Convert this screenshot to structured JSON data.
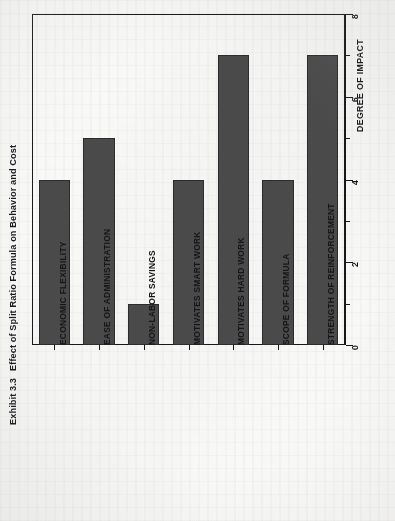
{
  "exhibit": {
    "number": "Exhibit 3.3",
    "title": "Effect of Split Ratio Formula on Behavior and Cost"
  },
  "colors": {
    "bar_fill": "#4a4a4a",
    "axis": "#17181c",
    "paper": "#fbfbfa",
    "text": "#15161a"
  },
  "chart_data": {
    "type": "bar",
    "orientation": "rotated-90-ccw",
    "title": "Effect of Split Ratio Formula on Behavior and Cost",
    "xlabel": "",
    "ylabel": "DEGREE OF IMPACT",
    "ylim": [
      0,
      8
    ],
    "grid": false,
    "legend": false,
    "categories": [
      "ECONOMIC FLEXIBILITY",
      "EASE OF ADMINISTRATION",
      "NON-LABOR SAVINGS",
      "MOTIVATES SMART WORK",
      "MOTIVATES HARD WORK",
      "SCOPE OF FORMULA",
      "STRENGTH OF REINFORCEMENT"
    ],
    "values": [
      4,
      5,
      1,
      4,
      7,
      4,
      7
    ],
    "tick_labels": [
      "0",
      "2",
      "4",
      "6",
      "8"
    ],
    "tick_values": [
      0,
      2,
      4,
      6,
      8
    ],
    "minor_tick_values": [
      1,
      3,
      5,
      7
    ]
  }
}
